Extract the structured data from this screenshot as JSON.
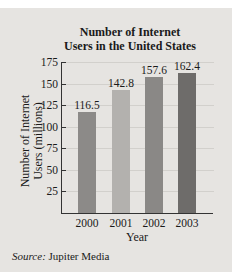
{
  "chart_data": {
    "type": "bar",
    "title": "Number of Internet Users in the United States",
    "title_lines": [
      "Number of Internet",
      "Users in the United States"
    ],
    "categories": [
      "2000",
      "2001",
      "2002",
      "2003"
    ],
    "values": [
      116.5,
      142.8,
      157.6,
      162.4
    ],
    "value_labels": [
      "116.5",
      "142.8",
      "157.6",
      "162.4"
    ],
    "xlabel": "Year",
    "ylabel": "Number of Internet Users (millions)",
    "ylabel_lines": [
      "Number of Internet",
      "Users (millions)"
    ],
    "ylim": [
      0,
      175
    ],
    "yticks": [
      "25",
      "50",
      "75",
      "100",
      "125",
      "150",
      "175"
    ],
    "grid": true,
    "bar_colors": [
      "#8c8a88",
      "#b3b1ae",
      "#8a8886",
      "#6e6c6a"
    ],
    "source_prefix": "Source:",
    "source_text": " Jupiter Media"
  }
}
